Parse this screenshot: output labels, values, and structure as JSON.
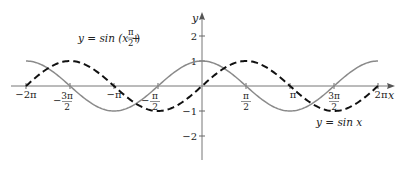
{
  "chart_data": {
    "type": "line",
    "title": "",
    "xlabel": "x",
    "ylabel": "y",
    "xlim": [
      -6.2832,
      6.2832
    ],
    "ylim": [
      -2.5,
      2.5
    ],
    "grid": false,
    "x_ticks": [
      {
        "value": -6.2832,
        "label": "−2π"
      },
      {
        "value": -4.7124,
        "label": "−3π/2"
      },
      {
        "value": -3.1416,
        "label": "−π"
      },
      {
        "value": -1.5708,
        "label": "−π/2"
      },
      {
        "value": 1.5708,
        "label": "π/2"
      },
      {
        "value": 3.1416,
        "label": "π"
      },
      {
        "value": 4.7124,
        "label": "3π/2"
      },
      {
        "value": 6.2832,
        "label": "2π"
      }
    ],
    "y_ticks": [
      {
        "value": 2,
        "label": "2"
      },
      {
        "value": 1,
        "label": "1"
      },
      {
        "value": -1,
        "label": "−1"
      },
      {
        "value": -2,
        "label": "−2"
      }
    ],
    "series": [
      {
        "name": "y = sin (x + π/2)",
        "style": "solid",
        "color": "#8a8a8a",
        "phase": 1.5708,
        "x": [
          -6.2832,
          -4.7124,
          -3.1416,
          -1.5708,
          0,
          1.5708,
          3.1416,
          4.7124,
          6.2832
        ],
        "values": [
          1,
          0,
          -1,
          0,
          1,
          0,
          -1,
          0,
          1
        ]
      },
      {
        "name": "y = sin x",
        "style": "dashed",
        "color": "#111111",
        "phase": 0,
        "x": [
          -6.2832,
          -4.7124,
          -3.1416,
          -1.5708,
          0,
          1.5708,
          3.1416,
          4.7124,
          6.2832
        ],
        "values": [
          0,
          1,
          0,
          -1,
          0,
          1,
          0,
          -1,
          0
        ]
      }
    ],
    "annotations": [
      {
        "text": "y = sin (x + π/2)",
        "target": "solid curve"
      },
      {
        "text": "y = sin x",
        "target": "dashed curve"
      }
    ],
    "legend": "none (inline annotations)"
  },
  "labels": {
    "y_axis": "y",
    "x_axis": "x",
    "solid_label_prefix": "y = sin (x + ",
    "solid_label_num": "π",
    "solid_label_den": "2",
    "solid_label_suffix": ")",
    "dashed_label": "y = sin x"
  }
}
